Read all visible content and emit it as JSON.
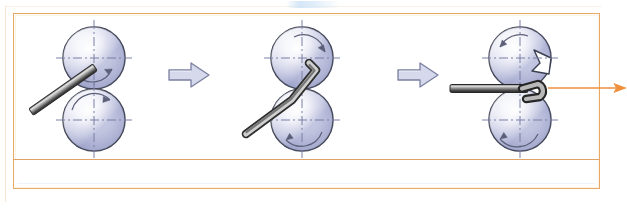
{
  "figure": {
    "kind": "technical-process-diagram",
    "caption_text": "",
    "top_artifact_text": "",
    "stage_count": 3,
    "separator_count": 2
  },
  "colors": {
    "frame_border": "#e8a866",
    "row_divider": "#e0a265",
    "output_arrow": "#ef8f3c",
    "roller_outline": "#3b3f52",
    "roller_light": "#ffffff",
    "roller_mid": "#c9ccE4",
    "roller_dark": "#8d93bb",
    "centerline": "#7a7fa6",
    "rod_dark": "#3a3a3a",
    "rod_light": "#d8d8d8",
    "sep_arrow_fill": "#d6d9ec",
    "sep_arrow_stroke": "#7a7fa0",
    "page_background": "#ffffff"
  },
  "stages": [
    {
      "id": "stage-1",
      "name": "feed",
      "label": "",
      "upper_roller": {
        "name": "upper-roller",
        "notched": false,
        "rotation": "clockwise",
        "rotation_arrow": true
      },
      "lower_roller": {
        "name": "lower-roller",
        "notched": false,
        "rotation": "counterclockwise",
        "rotation_arrow": true
      },
      "workpiece": {
        "name": "rod",
        "shape": "straight",
        "orientation": "diagonal",
        "angle_deg": -35,
        "bent": false
      }
    },
    {
      "id": "stage-2",
      "name": "engage",
      "label": "",
      "upper_roller": {
        "name": "upper-roller",
        "notched": false,
        "rotation": "clockwise",
        "rotation_arrow": true
      },
      "lower_roller": {
        "name": "lower-roller",
        "notched": false,
        "rotation": "counterclockwise",
        "rotation_arrow": true
      },
      "workpiece": {
        "name": "rod",
        "shape": "L-bent",
        "orientation": "diagonal",
        "angle_deg": -30,
        "bent": true
      }
    },
    {
      "id": "stage-3",
      "name": "form",
      "label": "",
      "upper_roller": {
        "name": "upper-roller-notched",
        "notched": true,
        "notch_side": "right",
        "rotation": "counterclockwise",
        "rotation_arrow": true
      },
      "lower_roller": {
        "name": "lower-roller",
        "notched": false,
        "rotation": "counterclockwise",
        "rotation_arrow": true
      },
      "workpiece": {
        "name": "rod",
        "shape": "hooked",
        "orientation": "horizontal",
        "angle_deg": 0,
        "bent": true
      }
    }
  ],
  "separators": [
    {
      "id": "separator-1",
      "glyph": "block-arrow-right",
      "direction": "right"
    },
    {
      "id": "separator-2",
      "glyph": "block-arrow-right",
      "direction": "right"
    }
  ],
  "output_arrow": {
    "id": "output-arrow",
    "direction": "right",
    "label": ""
  }
}
